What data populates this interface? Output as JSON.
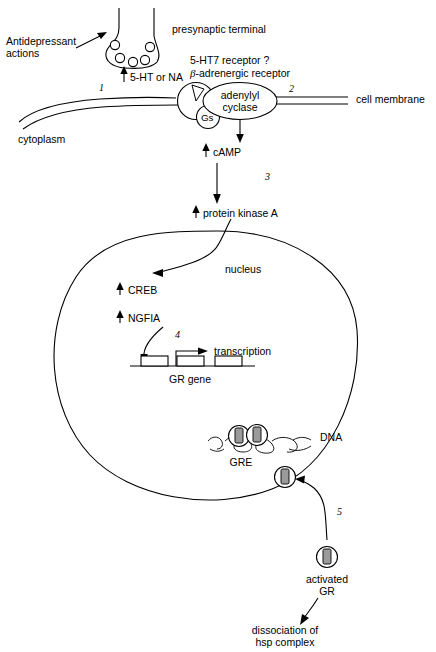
{
  "diagram": {
    "colors": {
      "line": "#000000",
      "background": "#ffffff",
      "gr_fill": "#9a9a9a"
    },
    "labels": {
      "antidepressant_actions_line1": "Antidepressant",
      "antidepressant_actions_line2": "actions",
      "presynaptic_terminal": "presynaptic terminal",
      "serotonin_or_na": "5-HT or NA",
      "receptor_line1": "5-HT7 receptor ?",
      "receptor_line2_italic": "β",
      "receptor_line2_rest": "-adrenergic receptor",
      "adenylyl": "adenylyl",
      "cyclase": "cyclase",
      "gs": "Gs",
      "cell_membrane": "cell membrane",
      "cytoplasm": "cytoplasm",
      "camp": "cAMP",
      "protein_kinase_a": "protein kinase A",
      "nucleus": "nucleus",
      "creb": "CREB",
      "ngfia": "NGFIA",
      "transcription": "transcription",
      "gr_gene": "GR gene",
      "gre": "GRE",
      "dna": "DNA",
      "activated_line1": "activated",
      "activated_line2": "GR",
      "dissociation_line1": "dissociation of",
      "dissociation_line2": "hsp complex"
    },
    "step_numbers": {
      "step1": "1",
      "step2": "2",
      "step3": "3",
      "step4": "4",
      "step5": "5"
    },
    "counts": {
      "synaptic_vesicles": 5,
      "gr_gene_exons": 3,
      "gr_bound_at_gre": 2
    }
  }
}
